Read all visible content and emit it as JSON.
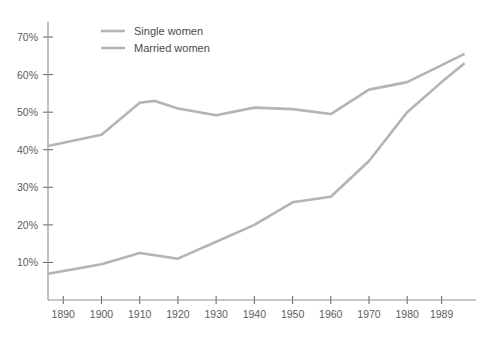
{
  "chart_data": {
    "type": "line",
    "title": "",
    "subtitle": "",
    "xlabel": "",
    "ylabel": "",
    "x": [
      1890,
      1900,
      1910,
      1920,
      1930,
      1940,
      1950,
      1960,
      1970,
      1980,
      1989,
      1995
    ],
    "xlim": [
      1886,
      1998
    ],
    "ylim": [
      0,
      74
    ],
    "grid": false,
    "legend_position": "top-left",
    "x_tick_labels": [
      "1890",
      "1900",
      "1910",
      "1920",
      "1930",
      "1940",
      "1950",
      "1960",
      "1970",
      "1980",
      "1989"
    ],
    "x_ticks": [
      1890,
      1900,
      1910,
      1920,
      1930,
      1940,
      1950,
      1960,
      1970,
      1980,
      1989
    ],
    "y_tick_labels": [
      "10%",
      "20%",
      "30%",
      "40%",
      "50%",
      "60%",
      "70%"
    ],
    "y_ticks": [
      10,
      20,
      30,
      40,
      50,
      60,
      70
    ],
    "series": [
      {
        "name": "Single women",
        "color": "#b4b4b4",
        "values": [
          41.0,
          44.0,
          52.5,
          53.0,
          51.0,
          49.2,
          51.2,
          50.8,
          49.5,
          56.0,
          58.0,
          65.5
        ],
        "x": [
          1886,
          1900,
          1910,
          1914,
          1920,
          1930,
          1940,
          1950,
          1960,
          1970,
          1980,
          1995
        ]
      },
      {
        "name": "Married women",
        "color": "#b4b4b4",
        "values": [
          7.0,
          9.5,
          12.5,
          11.0,
          15.5,
          20.0,
          26.0,
          27.5,
          37.0,
          50.0,
          58.0,
          63.0
        ],
        "x": [
          1886,
          1900,
          1910,
          1920,
          1930,
          1940,
          1950,
          1960,
          1970,
          1980,
          1989,
          1995
        ]
      }
    ]
  },
  "legend": {
    "items": [
      {
        "label": "Single women"
      },
      {
        "label": "Married women"
      }
    ]
  },
  "axes": {
    "y_axis_name": "percentage-axis",
    "x_axis_name": "year-axis"
  }
}
